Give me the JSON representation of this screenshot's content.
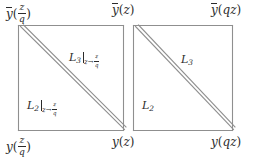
{
  "diagram": {
    "line_color": "#8f8f8f",
    "text_color": "#2b2b2b",
    "background": "#ffffff",
    "squares": [
      {
        "name": "left-square",
        "x": 18,
        "y": 25,
        "size": 105,
        "diagonal": "double",
        "upper_label": "L3|z->z/q",
        "lower_label": "L2|z->z/q"
      },
      {
        "name": "right-square",
        "x": 133,
        "y": 25,
        "size": 105,
        "diagonal": "double",
        "upper_label": "L3",
        "lower_label": "L2"
      }
    ],
    "corner_labels": {
      "top_left": {
        "base": "y",
        "bar": true,
        "arg": "z/q",
        "fraction": true
      },
      "top_middle": {
        "base": "y",
        "bar": true,
        "arg": "z",
        "fraction": false
      },
      "top_right": {
        "base": "y",
        "bar": true,
        "arg": "qz",
        "fraction": false
      },
      "bottom_left": {
        "base": "y",
        "bar": false,
        "arg": "z/q",
        "fraction": true
      },
      "bottom_middle": {
        "base": "y",
        "bar": false,
        "arg": "z",
        "fraction": false
      },
      "bottom_right": {
        "base": "y",
        "bar": false,
        "arg": "qz",
        "fraction": false
      }
    },
    "region_labels": {
      "left_upper": {
        "symbol": "L",
        "sub": "3",
        "restricted": true,
        "from": "z",
        "arrow": "→",
        "to_num": "z",
        "to_den": "q"
      },
      "left_lower": {
        "symbol": "L",
        "sub": "2",
        "restricted": true,
        "from": "z",
        "arrow": "→",
        "to_num": "z",
        "to_den": "q"
      },
      "right_upper": {
        "symbol": "L",
        "sub": "3",
        "restricted": false
      },
      "right_lower": {
        "symbol": "L",
        "sub": "2",
        "restricted": false
      }
    },
    "glyphs": {
      "open_paren": "(",
      "close_paren": ")",
      "slash_num": "z",
      "slash_den": "q",
      "q": "q",
      "z": "z",
      "qz": "qz",
      "y": "y"
    }
  }
}
